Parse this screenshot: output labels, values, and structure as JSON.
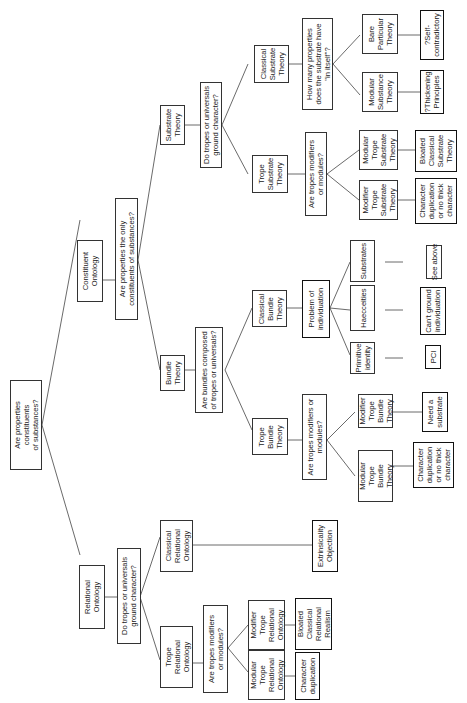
{
  "diagram": {
    "type": "tree",
    "orientation": "rotated-90-ccw",
    "nodes": {
      "root": "Are properties\nconstituents\nof substances?",
      "relational": "Relational\nOntology",
      "constituent": "Constituent\nOntology",
      "q_rel_ground": "Do tropes or universals\nground character?",
      "trope_rel": "Trope\nRelational\nOntology",
      "classical_rel": "Classical\nRelational\nOntology",
      "extrinsicality": "Extrinsicality\nObjection",
      "q_rel_mod": "Are tropes modifiers\nor modules?",
      "modular_trope_rel": "Modular\nTrope\nRelational\nOntology",
      "modifier_trope_rel": "Modifier\nTrope\nRelational\nOntology",
      "char_dup_rel": "Character\nduplication",
      "bloated_rel": "Bloated\nClassical\nRelational\nRealism",
      "q_const_only": "Are properties the only\nconstituents of substances?",
      "bundle": "Bundle\nTheory",
      "substrate": "Substrate\nTheory",
      "q_bundle_comp": "Are bundles composed\nof tropes or universals?",
      "trope_bundle": "Trope\nBundle\nTheory",
      "classical_bundle": "Classical\nBundle\nTheory",
      "q_bundle_mod": "Are tropes modifiers or\nmodules?",
      "modular_trope_bundle": "Modular\nTrope\nBundle\nTheory",
      "modifier_trope_bundle": "Modifier\nTrope\nBundle\nTheory",
      "char_dup_bundle": "Character\nduplication\nor no thick\ncharacter",
      "need_substrate": "Need a\nsubstrate",
      "problem_indiv": "Problem of\nindividuation",
      "primitive_identity": "Primitive\nidentity",
      "haecceities": "Haecceities",
      "substrates": "Substrates",
      "pci": "PCI",
      "cant_ground": "Can't ground\nindividuation",
      "see_above": "See above",
      "q_sub_ground": "Do tropes or universals\nground character?",
      "trope_substrate": "Trope\nSubstrate\nTheory",
      "classical_substrate": "Classical\nSubstrate\nTheory",
      "q_sub_mod": "Are tropes modifiers\nor modules?",
      "modifier_trope_sub": "Modifier\nTrope\nSubstrate\nTheory",
      "modular_trope_sub": "Modular\nTrope\nSubstrate\nTheory",
      "char_dup_sub": "Character\nduplication\nor no thick\ncharacter",
      "bloated_sub": "Bloated\nClassical\nSubstrate\nTheory",
      "q_how_many": "How many properties\ndoes the substrate have\n\"in itself\"?",
      "modular_substance": "Modular\nSubstance\nTheory",
      "bare_particular": "Bare\nParticular\nTheory",
      "thickening": "?Thickening\nPrinciples",
      "self_contradictory": "?Self-\ncontradictory"
    }
  }
}
